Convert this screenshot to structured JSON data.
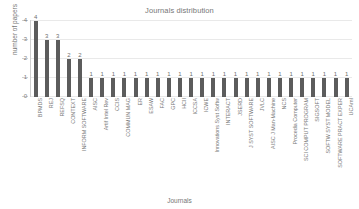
{
  "chart_data": {
    "type": "bar",
    "title": "Journals distribution",
    "xlabel": "Journals",
    "ylabel": "number of papers",
    "ylim": [
      0,
      4
    ],
    "yticks": [
      0,
      1,
      2,
      3,
      4
    ],
    "grid": true,
    "legend": null,
    "bar_color": "#5c5c5c",
    "show_value_labels": true,
    "categories": [
      "BPMDS",
      "REJ",
      "REFSQ",
      "CONTEXT",
      "INFORM SOFTWARE",
      "AISC",
      "Artif Intel Rev",
      "CCIS",
      "COMMUN MAG",
      "ER",
      "ESAW",
      "FAC",
      "GPC",
      "HCII",
      "ICCSA",
      "ICWE",
      "Innovations Syst Softw",
      "INTERACT",
      "JSERD",
      "J SYST SOFTWARE",
      "JVLC",
      "AISC J Man-Machine",
      "NCS",
      "Procedia Computer",
      "SCI COMPUT PROGRAM",
      "SIGSOFT",
      "SOFTW SYST MODEL",
      "SOFTWARE PRACT EXPER",
      "UCAmI"
    ],
    "values": [
      4,
      3,
      3,
      2,
      2,
      1,
      1,
      1,
      1,
      1,
      1,
      1,
      1,
      1,
      1,
      1,
      1,
      1,
      1,
      1,
      1,
      1,
      1,
      1,
      1,
      1,
      1,
      1,
      1
    ]
  }
}
